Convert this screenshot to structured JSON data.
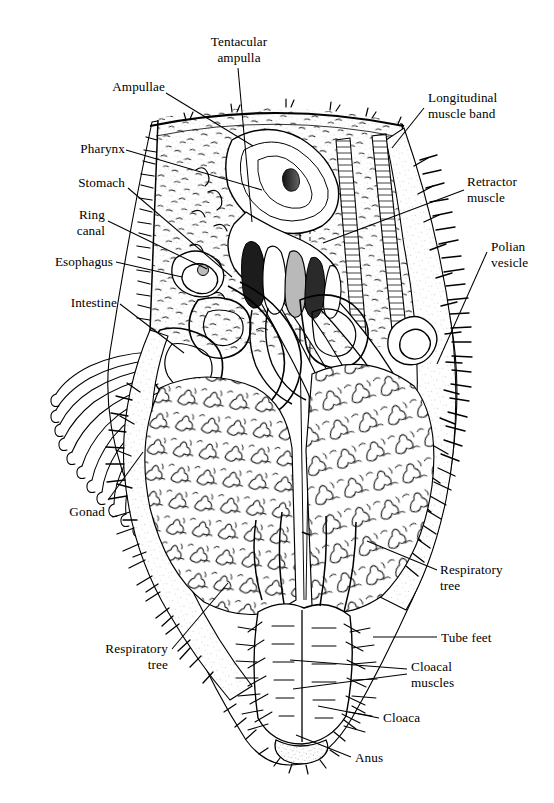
{
  "figure": {
    "kind": "anatomical-diagram",
    "style": "black-and-white line drawing with stipple and hatch shading",
    "background_color": "#ffffff",
    "ink_color": "#000000"
  },
  "labels": [
    {
      "id": "tentacular-ampulla",
      "text": "Tentacular\nampulla",
      "align": "center",
      "x": 184,
      "y": 34,
      "w": 110
    },
    {
      "id": "ampullae",
      "text": "Ampullae",
      "align": "right",
      "x": 45,
      "y": 79,
      "w": 120
    },
    {
      "id": "longitudinal-muscle-band",
      "text": "Longitudinal\nmuscle band",
      "align": "left",
      "x": 428,
      "y": 90,
      "w": 120
    },
    {
      "id": "pharynx",
      "text": "Pharynx",
      "align": "right",
      "x": 20,
      "y": 141,
      "w": 125
    },
    {
      "id": "stomach",
      "text": "Stomach",
      "align": "right",
      "x": 20,
      "y": 175,
      "w": 125
    },
    {
      "id": "retractor-muscle",
      "text": "Retractor\nmuscle",
      "align": "left",
      "x": 467,
      "y": 174,
      "w": 110
    },
    {
      "id": "ring-canal",
      "text": "Ring\ncanal",
      "align": "right",
      "x": 20,
      "y": 207,
      "w": 105
    },
    {
      "id": "polian-vesicle",
      "text": "Polian\nvesicle",
      "align": "left",
      "x": 491,
      "y": 239,
      "w": 105
    },
    {
      "id": "esophagus",
      "text": "Esophagus",
      "align": "right",
      "x": 12,
      "y": 254,
      "w": 133
    },
    {
      "id": "intestine",
      "text": "Intestine",
      "align": "right",
      "x": 20,
      "y": 295,
      "w": 125
    },
    {
      "id": "gonad",
      "text": "Gonad",
      "align": "right",
      "x": 20,
      "y": 504,
      "w": 125
    },
    {
      "id": "respiratory-tree-right",
      "text": "Respiratory\ntree",
      "align": "left",
      "x": 440,
      "y": 562,
      "w": 110
    },
    {
      "id": "respiratory-tree-left",
      "text": "Respiratory\ntree",
      "align": "right",
      "x": 50,
      "y": 641,
      "w": 120
    },
    {
      "id": "tube-feet",
      "text": "Tube feet",
      "align": "left",
      "x": 441,
      "y": 630,
      "w": 110
    },
    {
      "id": "cloacal-muscles",
      "text": "Cloacal\nmuscles",
      "align": "left",
      "x": 411,
      "y": 665,
      "w": 120
    },
    {
      "id": "cloaca",
      "text": "Cloaca",
      "align": "left",
      "x": 383,
      "y": 713,
      "w": 110
    },
    {
      "id": "anus",
      "text": "Anus",
      "align": "left",
      "x": 355,
      "y": 753,
      "w": 100
    }
  ],
  "leader_lines": [
    {
      "id": "leader-tentacular-ampulla",
      "from": [
        238,
        68
      ],
      "to": [
        252,
        222
      ]
    },
    {
      "id": "leader-ampullae",
      "from": [
        166,
        93
      ],
      "to": [
        253,
        146
      ]
    },
    {
      "id": "leader-longitudinal-muscle",
      "from": [
        424,
        108
      ],
      "to": [
        392,
        148
      ]
    },
    {
      "id": "leader-pharynx",
      "from": [
        126,
        150
      ],
      "to": [
        262,
        190
      ]
    },
    {
      "id": "leader-stomach",
      "from": [
        128,
        188
      ],
      "to": [
        232,
        277
      ]
    },
    {
      "id": "leader-retractor-muscle",
      "from": [
        464,
        190
      ],
      "to": [
        323,
        243
      ]
    },
    {
      "id": "leader-ring-canal",
      "from": [
        108,
        221
      ],
      "to": [
        207,
        269
      ]
    },
    {
      "id": "leader-polian-vesicle",
      "from": [
        487,
        252
      ],
      "to": [
        437,
        364
      ]
    },
    {
      "id": "leader-esophagus",
      "from": [
        116,
        262
      ],
      "to": [
        182,
        277
      ]
    },
    {
      "id": "leader-intestine",
      "from": [
        120,
        304
      ],
      "to": [
        184,
        353
      ]
    },
    {
      "id": "leader-gonad",
      "from": [
        108,
        500
      ],
      "to": [
        143,
        452
      ]
    },
    {
      "id": "leader-respiratory-tree-right",
      "from": [
        437,
        570
      ],
      "to": [
        367,
        541
      ]
    },
    {
      "id": "leader-respiratory-tree-left",
      "from": [
        172,
        649
      ],
      "to": [
        228,
        583
      ]
    },
    {
      "id": "leader-tube-feet",
      "from": [
        437,
        637
      ],
      "to": [
        373,
        637
      ]
    },
    {
      "id": "leader-cloacal-muscles-a",
      "from": [
        407,
        669
      ],
      "to": [
        290,
        660
      ]
    },
    {
      "id": "leader-cloacal-muscles-b",
      "from": [
        407,
        674
      ],
      "to": [
        293,
        689
      ]
    },
    {
      "id": "leader-cloaca",
      "from": [
        379,
        718
      ],
      "to": [
        318,
        706
      ]
    },
    {
      "id": "leader-anus",
      "from": [
        351,
        757
      ],
      "to": [
        296,
        735
      ]
    }
  ],
  "structures": {
    "body_wall": "outer body wall flap, opened dorsally, fringed with papillae and tube feet",
    "tube_feet_fringe": "dense spiky projections along left and right body margins",
    "respiratory_tree_masses": "two large branched lobed masses filling lower half",
    "gut_coil": "looping tubular intestine coiled at mid-left",
    "gonad_tufts": "bundle of fine elongated tubules on left flank",
    "cloaca_region": "muscular chamber at base with radiating cloacal muscle fibers",
    "anus_opening": "terminal opening at bottom of body"
  }
}
